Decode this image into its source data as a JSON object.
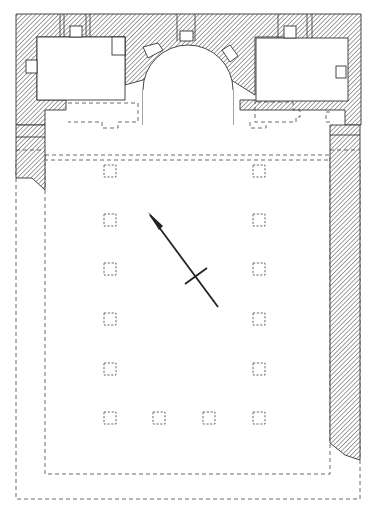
{
  "figure": {
    "type": "architectural-floor-plan",
    "colors": {
      "line": "#333333",
      "hatch": "#555555",
      "background": "#ffffff"
    },
    "elements": {
      "apse": {
        "label": "central-apse"
      },
      "side_chambers": [
        "north-chamber",
        "south-chamber"
      ],
      "column_bases": {
        "left_row_count": 6,
        "right_row_count": 6,
        "middle_bottom_count": 2
      },
      "north_arrow": {
        "label": "north-arrow"
      }
    }
  }
}
